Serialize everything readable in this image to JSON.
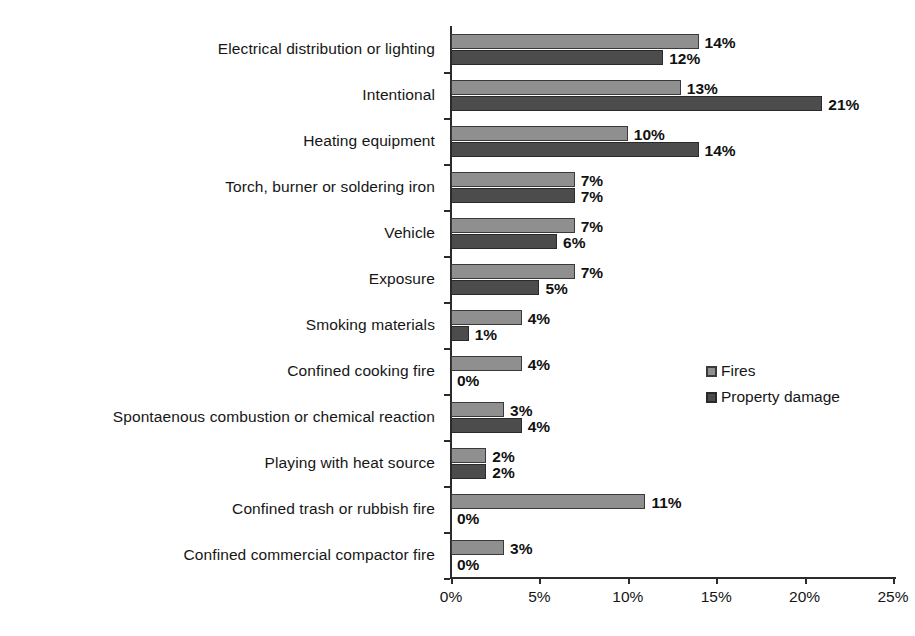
{
  "chart_data": {
    "type": "bar",
    "orientation": "horizontal",
    "title": "",
    "subtitle": "",
    "xlabel": "",
    "ylabel": "",
    "xlim": [
      0,
      25
    ],
    "xtick_labels": [
      "0%",
      "5%",
      "10%",
      "15%",
      "20%",
      "25%"
    ],
    "xtick_values": [
      0,
      5,
      10,
      15,
      20,
      25
    ],
    "grid": false,
    "value_suffix": "%",
    "legend_position": "middle-right",
    "categories": [
      "Electrical distribution or lighting",
      "Intentional",
      "Heating equipment",
      "Torch, burner or soldering iron",
      "Vehicle",
      "Exposure",
      "Smoking materials",
      "Confined cooking fire",
      "Spontaenous combustion or chemical reaction",
      "Playing with heat source",
      "Confined trash or rubbish fire",
      "Confined commercial compactor fire"
    ],
    "series": [
      {
        "name": "Fires",
        "color": "#8f8f8f",
        "values": [
          14,
          13,
          10,
          7,
          7,
          7,
          4,
          4,
          3,
          2,
          11,
          3
        ],
        "labels": [
          "14%",
          "13%",
          "10%",
          "7%",
          "7%",
          "7%",
          "4%",
          "4%",
          "3%",
          "2%",
          "11%",
          "3%"
        ]
      },
      {
        "name": "Property damage",
        "color": "#4c4c4c",
        "values": [
          12,
          21,
          14,
          7,
          6,
          5,
          1,
          0,
          4,
          2,
          0,
          0
        ],
        "labels": [
          "12%",
          "21%",
          "14%",
          "7%",
          "6%",
          "5%",
          "1%",
          "0%",
          "4%",
          "2%",
          "0%",
          "0%"
        ]
      }
    ]
  },
  "legend": {
    "items": [
      {
        "label": "Fires",
        "swatch": "fires-swatch-icon"
      },
      {
        "label": "Property damage",
        "swatch": "property-damage-swatch-icon"
      }
    ]
  }
}
